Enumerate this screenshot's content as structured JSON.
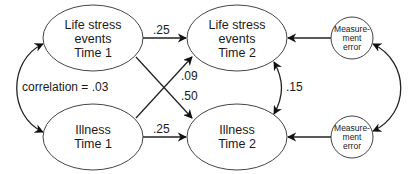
{
  "diagram": {
    "type": "path-diagram",
    "nodes": {
      "stress1": {
        "lines": [
          "Life stress",
          "events",
          "Time 1"
        ]
      },
      "illness1": {
        "lines": [
          "Illness",
          "Time 1"
        ]
      },
      "stress2": {
        "lines": [
          "Life stress",
          "events",
          "Time 2"
        ]
      },
      "illness2": {
        "lines": [
          "Illness",
          "Time 2"
        ]
      },
      "error_top": {
        "lines": [
          "Measure-",
          "ment",
          "error"
        ]
      },
      "error_bottom": {
        "lines": [
          "Measure-",
          "ment",
          "error"
        ]
      }
    },
    "edges": {
      "stress1_to_stress2": ".25",
      "illness1_to_stress2": ".09",
      "stress1_to_illness2": ".50",
      "illness1_to_illness2": ".25",
      "stress2_illness2_correlation": ".15",
      "time1_correlation": "correlation = .03"
    },
    "colors": {
      "stroke": "#222222",
      "shape_stroke": "#444444",
      "background": "#ffffff"
    }
  }
}
